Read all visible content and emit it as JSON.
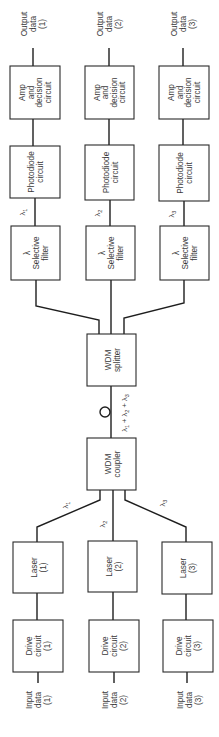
{
  "diagram": {
    "orientation": "rotated-90-ccw",
    "channels": [
      {
        "id": 1,
        "output": [
          "Output",
          "data",
          "(1)"
        ],
        "amp": [
          "Amp",
          "and",
          "decision",
          "circuit"
        ],
        "photodiode": [
          "Photodiode",
          "circuit"
        ],
        "rx_lambda": "λ",
        "rx_lambda_sub": "1",
        "filter": [
          "λ",
          "Selective",
          "filter"
        ],
        "laser": [
          "Laser",
          "(1)"
        ],
        "tx_lambda": "λ",
        "tx_lambda_sub": "1",
        "drive": [
          "Drive",
          "circuit",
          "(1)"
        ],
        "input": [
          "Input",
          "data",
          "(1)"
        ]
      },
      {
        "id": 2,
        "output": [
          "Output",
          "data",
          "(2)"
        ],
        "amp": [
          "Amp",
          "and",
          "decision",
          "circuit"
        ],
        "photodiode": [
          "Photodiode",
          "circuit"
        ],
        "rx_lambda": "λ",
        "rx_lambda_sub": "2",
        "filter": [
          "λ",
          "Selective",
          "filter"
        ],
        "laser": [
          "Laser",
          "(2)"
        ],
        "tx_lambda": "λ",
        "tx_lambda_sub": "2",
        "drive": [
          "Drive",
          "circuit",
          "(2)"
        ],
        "input": [
          "Input",
          "data",
          "(2)"
        ]
      },
      {
        "id": 3,
        "output": [
          "Output",
          "data",
          "(3)"
        ],
        "amp": [
          "Amp",
          "and",
          "decision",
          "circuit"
        ],
        "photodiode": [
          "Photodiode",
          "circuit"
        ],
        "rx_lambda": "λ",
        "rx_lambda_sub": "3",
        "filter": [
          "λ",
          "Selective",
          "filter"
        ],
        "laser": [
          "Laser",
          "(3)"
        ],
        "tx_lambda": "λ",
        "tx_lambda_sub": "3",
        "drive": [
          "Drive",
          "circuit",
          "(3)"
        ],
        "input": [
          "Input",
          "data",
          "(3)"
        ]
      }
    ],
    "splitter": [
      "WDM",
      "splitter"
    ],
    "coupler": [
      "WDM",
      "coupler"
    ],
    "fiber_label": {
      "parts": [
        "λ",
        "1",
        " + ",
        "λ",
        "2",
        " + ",
        "λ",
        "3"
      ]
    },
    "colors": {
      "stroke": "#1e1e1e",
      "text": "#3a3a3a",
      "background": "#ffffff"
    }
  }
}
